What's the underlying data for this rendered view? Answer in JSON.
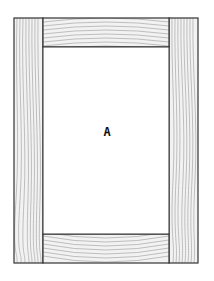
{
  "diagram": {
    "type": "cabinet door frame (stiles and rails)",
    "panel_label": "A",
    "colors": {
      "outline": "#333333",
      "grain": "#9a9a9a",
      "wood_fill": "#f2f2f2",
      "panel_fill": "#ffffff"
    },
    "parts": [
      {
        "name": "left-stile",
        "orientation": "vertical"
      },
      {
        "name": "right-stile",
        "orientation": "vertical"
      },
      {
        "name": "top-rail",
        "orientation": "horizontal"
      },
      {
        "name": "bottom-rail",
        "orientation": "horizontal"
      },
      {
        "name": "center-panel",
        "label": "A"
      }
    ]
  }
}
